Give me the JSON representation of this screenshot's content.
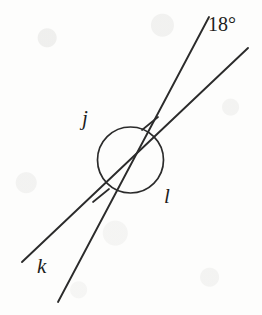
{
  "figure": {
    "kind": "geometry-diagram",
    "background_color": "#fdfdfc",
    "stroke_color": "#2b2b2b",
    "text_color": "#1d1d1d",
    "width": 262,
    "height": 315
  },
  "labels": {
    "line_j": "j",
    "line_k": "k",
    "line_l": "l",
    "angle_measure": "18°"
  },
  "geometry": {
    "intersection": {
      "x": 131,
      "y": 167
    },
    "circle": {
      "cx": 130.5,
      "cy": 160,
      "r": 33
    },
    "lines": [
      {
        "name": "line-j",
        "label": "j",
        "x1": 58,
        "y1": 302,
        "x2": 209,
        "y2": 17
      },
      {
        "name": "line-kl",
        "label_start": "k",
        "label_end": "l",
        "x1": 22,
        "y1": 262,
        "x2": 248,
        "y2": 48
      }
    ],
    "angle_ticks": [
      {
        "name": "tick-upper-right",
        "x1": 142,
        "y1": 130,
        "x2": 158,
        "y2": 117
      },
      {
        "name": "tick-lower-left",
        "x1": 93,
        "y1": 202,
        "x2": 109,
        "y2": 189
      }
    ],
    "label_positions": {
      "j": {
        "x": 82,
        "y": 108
      },
      "l": {
        "x": 164,
        "y": 186
      },
      "k": {
        "x": 37,
        "y": 256
      },
      "18deg": {
        "x": 208,
        "y": 14
      }
    }
  }
}
